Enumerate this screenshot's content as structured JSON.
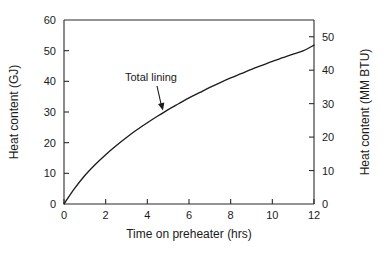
{
  "chart_data": {
    "type": "line",
    "title": "",
    "xlabel": "Time on preheater (hrs)",
    "ylabel": "Heat content (GJ)",
    "y2label": "Heat content (MM BTU)",
    "xlim": [
      0,
      12
    ],
    "ylim": [
      0,
      60
    ],
    "y2lim": [
      0,
      55
    ],
    "grid": false,
    "legend": "none",
    "xticks": [
      0,
      2,
      4,
      6,
      8,
      10,
      12
    ],
    "xtick_labels": [
      "0",
      "2",
      "4",
      "6",
      "8",
      "10",
      "12"
    ],
    "yticks": [
      0,
      10,
      20,
      30,
      40,
      50,
      60
    ],
    "ytick_labels": [
      "0",
      "10",
      "20",
      "30",
      "40",
      "50",
      "60"
    ],
    "y2ticks": [
      0,
      10,
      20,
      30,
      40,
      50
    ],
    "y2tick_labels": [
      "0",
      "10",
      "20",
      "30",
      "40",
      "50"
    ],
    "series": [
      {
        "name": "Total lining",
        "x": [
          0,
          0.5,
          1,
          1.5,
          2,
          2.5,
          3,
          3.5,
          4,
          4.5,
          5,
          5.5,
          6,
          6.5,
          7,
          7.5,
          8,
          8.5,
          9,
          9.5,
          10,
          10.5,
          11,
          11.5,
          12
        ],
        "values": [
          0,
          5.0,
          9.3,
          12.9,
          16.1,
          19.0,
          21.7,
          24.2,
          26.5,
          28.7,
          30.8,
          32.7,
          34.6,
          36.3,
          38.0,
          39.6,
          41.1,
          42.5,
          43.9,
          45.2,
          46.5,
          47.7,
          48.9,
          50.0,
          51.8
        ]
      }
    ],
    "annotations": [
      {
        "text": "Total lining",
        "x": 2.2,
        "y": 44.0,
        "points_to_x": 4.75,
        "points_to_y": 30.5
      }
    ]
  },
  "axes": {
    "left_title": "Heat content (GJ)",
    "right_title": "Heat content (MM BTU)",
    "bottom_title": "Time on preheater (hrs)"
  },
  "colors": {
    "curve": "#1c1c1c",
    "axis": "#2b2b2b",
    "text": "#1a1a1a",
    "background": "#ffffff"
  }
}
